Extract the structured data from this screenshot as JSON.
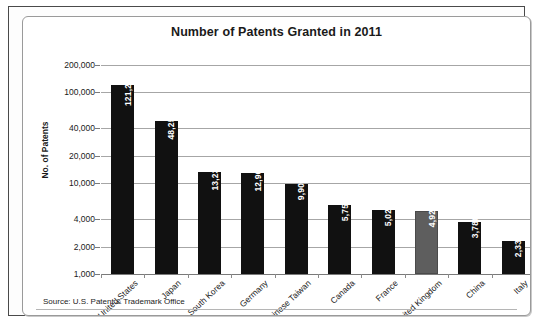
{
  "chart_data": {
    "type": "bar",
    "title": "Number of Patents Granted in 2011",
    "xlabel": "",
    "ylabel": "No. of Patents",
    "yscale": "log",
    "ylim": [
      1000,
      200000
    ],
    "ytick_labels": [
      "200,000",
      "100,000",
      "40,000",
      "20,000",
      "10,000",
      "4,000",
      "2,000",
      "1,000"
    ],
    "ytick_values": [
      200000,
      100000,
      40000,
      20000,
      10000,
      4000,
      2000,
      1000
    ],
    "grid": true,
    "legend": "none",
    "categories": [
      "United States",
      "Japan",
      "South Korea",
      "Germany",
      "Chinese Taiwan",
      "Canada",
      "France",
      "United Kingdom",
      "China",
      "Italy"
    ],
    "values": [
      121261,
      48256,
      13239,
      12968,
      9907,
      5754,
      5022,
      4924,
      3786,
      2333
    ],
    "value_labels": [
      "121,261",
      "48,256",
      "13,239",
      "12,968",
      "9,907",
      "5,754",
      "5,022",
      "4,924",
      "3,786",
      "2,333"
    ],
    "bar_colors": [
      "#111111",
      "#111111",
      "#111111",
      "#111111",
      "#111111",
      "#111111",
      "#111111",
      "#5e5e5e",
      "#111111",
      "#111111"
    ],
    "highlighted_category": "United Kingdom",
    "annotations": [
      "Source: U.S. Patent & Trademark Office"
    ]
  },
  "figure": {
    "title": "Number of Patents Granted in 2011",
    "y_axis_title": "No. of Patents",
    "source_note": "Source: U.S. Patent & Trademark Office"
  }
}
